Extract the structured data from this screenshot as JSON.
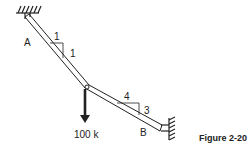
{
  "figure": {
    "caption": "Figure 2-20",
    "labels": {
      "support_a": "A",
      "support_b": "B",
      "slope1_run": "1",
      "slope1_rise": "1",
      "slope2_run": "4",
      "slope2_rise": "3",
      "load": "100 k"
    },
    "colors": {
      "line": "#222222",
      "background": "#ffffff"
    }
  }
}
